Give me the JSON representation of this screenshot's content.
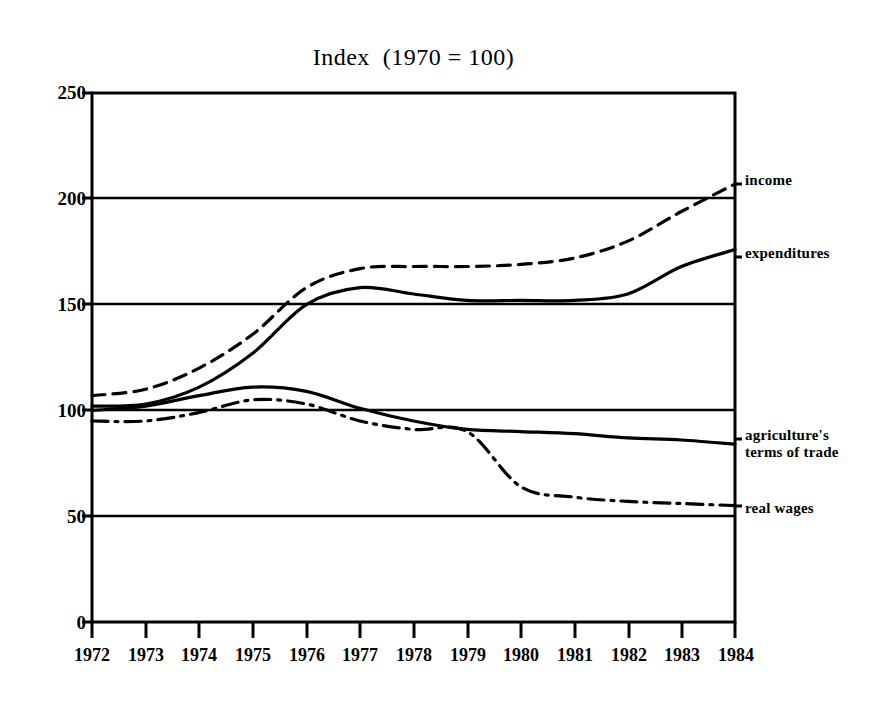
{
  "chart_data": {
    "type": "line",
    "title": "Index  (1970 = 100)",
    "xlabel": "",
    "ylabel": "",
    "xlim": [
      1972,
      1984
    ],
    "ylim": [
      0,
      250
    ],
    "yticks": [
      0,
      50,
      100,
      150,
      200,
      250
    ],
    "xticks": [
      1972,
      1973,
      1974,
      1975,
      1976,
      1977,
      1978,
      1979,
      1980,
      1981,
      1982,
      1983,
      1984
    ],
    "grid": "horizontal",
    "legend_position": "right-of-axes-inline",
    "x": [
      1972,
      1973,
      1974,
      1975,
      1976,
      1977,
      1978,
      1979,
      1980,
      1981,
      1982,
      1983,
      1984
    ],
    "series": [
      {
        "name": "income",
        "label": "income",
        "style": "dashed",
        "color": "#000000",
        "values": [
          107,
          110,
          120,
          136,
          158,
          167,
          168,
          168,
          169,
          172,
          180,
          194,
          207
        ],
        "label_y_value": 207
      },
      {
        "name": "expenditures",
        "label": "expenditures",
        "style": "solid",
        "color": "#000000",
        "values": [
          102,
          103,
          111,
          127,
          150,
          158,
          155,
          152,
          152,
          152,
          155,
          168,
          176
        ],
        "label_y_value": 176
      },
      {
        "name": "agriculture's terms of trade",
        "label": "agriculture's\nterms of trade",
        "style": "solid",
        "color": "#000000",
        "values": [
          100,
          102,
          107,
          111,
          109,
          101,
          95,
          91,
          90,
          89,
          87,
          86,
          84
        ],
        "label_y_value": 86
      },
      {
        "name": "real wages",
        "label": "real wages",
        "style": "dash-dot",
        "color": "#000000",
        "values": [
          95,
          95,
          99,
          105,
          103,
          95,
          91,
          90,
          64,
          59,
          57,
          56,
          55
        ],
        "label_y_value": 55
      }
    ]
  },
  "axes": {
    "y_tick_labels": [
      "250",
      "200",
      "150",
      "100",
      "50",
      "0"
    ],
    "x_tick_labels": [
      "1972",
      "1973",
      "1974",
      "1975",
      "1976",
      "1977",
      "1978",
      "1979",
      "1980",
      "1981",
      "1982",
      "1983",
      "1984"
    ]
  },
  "labels": {
    "income": "income",
    "expenditures": "expenditures",
    "agriculture": "agriculture's\nterms of trade",
    "real_wages": "real wages"
  },
  "title": "Index  (1970 = 100)",
  "colors": {
    "line": "#000000",
    "background": "#ffffff",
    "axis": "#000000"
  }
}
